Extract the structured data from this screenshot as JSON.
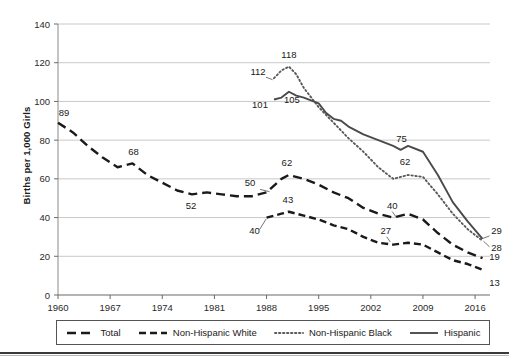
{
  "chart_data": {
    "type": "line",
    "title": "",
    "xlabel": "",
    "ylabel": "Births per 1,000 Girls",
    "xlim": [
      1960,
      2018
    ],
    "ylim": [
      0,
      140
    ],
    "ytick_step": 20,
    "yticks": [
      "0",
      "20",
      "40",
      "60",
      "80",
      "100",
      "120",
      "140"
    ],
    "xticks": [
      "1960",
      "1967",
      "1974",
      "1981",
      "1988",
      "1995",
      "2002",
      "2009",
      "2016"
    ],
    "grid": "horizontal",
    "legend_position": "bottom",
    "series": [
      {
        "name": "Total",
        "style": "dashed-long",
        "color": "#1a1a1a",
        "x": [
          1960,
          1962,
          1964,
          1966,
          1968,
          1970,
          1972,
          1974,
          1976,
          1978,
          1980,
          1982,
          1984,
          1986,
          1988,
          1990,
          1991,
          1993,
          1995,
          1997,
          1999,
          2001,
          2003,
          2005,
          2007,
          2009,
          2011,
          2013,
          2015,
          2017
        ],
        "y": [
          89,
          84,
          77,
          71,
          66,
          68,
          62,
          58,
          54,
          52,
          53,
          52,
          51,
          51,
          53,
          60,
          62,
          60,
          57,
          53,
          50,
          45,
          42,
          40,
          42,
          39,
          32,
          26,
          22,
          19
        ],
        "labels": [
          {
            "text": "89",
            "x": 1960,
            "y": 89
          },
          {
            "text": "68",
            "x": 1970,
            "y": 68
          },
          {
            "text": "52",
            "x": 1978,
            "y": 52
          },
          {
            "text": "50",
            "x": 1987,
            "y": 53
          },
          {
            "text": "62",
            "x": 1991,
            "y": 62
          },
          {
            "text": "40",
            "x": 2005,
            "y": 40
          },
          {
            "text": "19",
            "x": 2017,
            "y": 19
          }
        ]
      },
      {
        "name": "Non-Hispanic White",
        "style": "dashed-short",
        "color": "#1a1a1a",
        "x": [
          1988,
          1990,
          1991,
          1993,
          1995,
          1997,
          1999,
          2001,
          2003,
          2005,
          2007,
          2009,
          2011,
          2013,
          2015,
          2017
        ],
        "y": [
          40,
          42,
          43,
          41,
          39,
          36,
          34,
          30,
          27,
          26,
          27,
          26,
          22,
          18,
          16,
          13
        ],
        "labels": [
          {
            "text": "40",
            "x": 1988,
            "y": 40
          },
          {
            "text": "43",
            "x": 1991,
            "y": 43
          },
          {
            "text": "27",
            "x": 2004,
            "y": 27
          },
          {
            "text": "13",
            "x": 2017,
            "y": 13
          }
        ]
      },
      {
        "name": "Non-Hispanic Black",
        "style": "dotted",
        "color": "#5a5a5a",
        "x": [
          1989,
          1990,
          1991,
          1992,
          1993,
          1995,
          1997,
          1999,
          2001,
          2003,
          2005,
          2007,
          2009,
          2011,
          2013,
          2015,
          2017
        ],
        "y": [
          112,
          116,
          118,
          114,
          107,
          97,
          89,
          81,
          74,
          66,
          60,
          62,
          61,
          52,
          42,
          34,
          28
        ],
        "labels": [
          {
            "text": "112",
            "x": 1989,
            "y": 112
          },
          {
            "text": "118",
            "x": 1991,
            "y": 118
          },
          {
            "text": "62",
            "x": 2007,
            "y": 62
          },
          {
            "text": "28",
            "x": 2017,
            "y": 28
          }
        ]
      },
      {
        "name": "Hispanic",
        "style": "solid",
        "color": "#4a4a4a",
        "x": [
          1989,
          1990,
          1991,
          1992,
          1993,
          1995,
          1996,
          1997,
          1998,
          1999,
          2001,
          2003,
          2005,
          2006,
          2007,
          2009,
          2011,
          2013,
          2015,
          2017
        ],
        "y": [
          101,
          102,
          105,
          103,
          102,
          99,
          94,
          91,
          90,
          87,
          83,
          80,
          77,
          75,
          77,
          74,
          62,
          48,
          38,
          29
        ],
        "labels": [
          {
            "text": "101",
            "x": 1989,
            "y": 101
          },
          {
            "text": "105",
            "x": 1991,
            "y": 105
          },
          {
            "text": "75",
            "x": 2006,
            "y": 75
          },
          {
            "text": "29",
            "x": 2017,
            "y": 29
          }
        ]
      }
    ]
  },
  "legend": {
    "items": [
      {
        "label": "Total",
        "style": "dashed-long"
      },
      {
        "label": "Non-Hispanic White",
        "style": "dashed-short"
      },
      {
        "label": "Non-Hispanic Black",
        "style": "dotted"
      },
      {
        "label": "Hispanic",
        "style": "solid"
      }
    ]
  },
  "axis": {
    "y_title": "Births per 1,000 Girls"
  }
}
